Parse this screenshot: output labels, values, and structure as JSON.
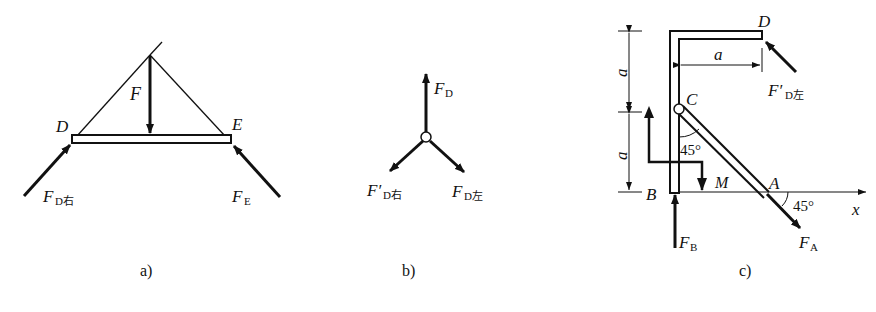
{
  "panels": [
    {
      "id": "a",
      "caption": "a)",
      "points": {
        "D": "D",
        "E": "E"
      },
      "forces": {
        "F": {
          "symbol": "F",
          "sub": ""
        },
        "F_D_right": {
          "symbol": "F",
          "sub": "D右"
        },
        "F_E": {
          "symbol": "F",
          "sub": "E"
        }
      }
    },
    {
      "id": "b",
      "caption": "b)",
      "forces": {
        "F_D": {
          "symbol": "F",
          "sub": "D"
        },
        "F_D_right_prime": {
          "symbol": "F′",
          "sub": "D右"
        },
        "F_D_left": {
          "symbol": "F",
          "sub": "D左"
        }
      }
    },
    {
      "id": "c",
      "caption": "c)",
      "points": {
        "D": "D",
        "C": "C",
        "B": "B",
        "A": "A",
        "M": "M"
      },
      "dimensions": {
        "top_vertical": "a",
        "bottom_vertical": "a",
        "horizontal": "a"
      },
      "angles": {
        "at_C": "45°",
        "at_A": "45°"
      },
      "axis": "x",
      "forces": {
        "F_D_left_prime": {
          "symbol": "F′",
          "sub": "D左"
        },
        "F_B": {
          "symbol": "F",
          "sub": "B"
        },
        "F_A": {
          "symbol": "F",
          "sub": "A"
        }
      }
    }
  ]
}
